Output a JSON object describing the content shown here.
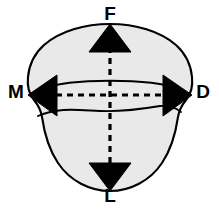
{
  "figure": {
    "background_color": "#ffffff",
    "outline_color": "#000000",
    "fill_color": "#e9e9e9",
    "arrow_color": "#000000",
    "axis_line_style": "dashed"
  },
  "labels": {
    "superior": "F",
    "inferior": "L",
    "medial": "M",
    "lateral": "D"
  },
  "axes": [
    {
      "name": "vertical-axis",
      "from_label": "F",
      "to_label": "L",
      "orientation": "vertical",
      "style": "dashed",
      "arrowheads": "both"
    },
    {
      "name": "horizontal-axis",
      "from_label": "M",
      "to_label": "D",
      "orientation": "horizontal",
      "style": "dashed",
      "arrowheads": "both"
    }
  ],
  "internal_contours": [
    {
      "name": "upper-contour-line",
      "style": "solid"
    },
    {
      "name": "lower-contour-line",
      "style": "solid"
    }
  ]
}
